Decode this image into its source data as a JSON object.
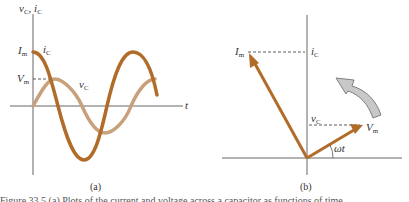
{
  "colors": {
    "current": "#b06c28",
    "voltage": "#c8a07c",
    "axis": "#555555",
    "rotation_arrow_fill": "#c8c8c8",
    "rotation_arrow_stroke": "#666666"
  },
  "panel_a": {
    "label": "(a)",
    "y_axis_label": "v",
    "y_axis_label_sub": "C",
    "y_axis_label_sep": ", ",
    "y_axis_label_2": "i",
    "y_axis_label_2_sub": "C",
    "x_axis_label": "t",
    "im_label": "I",
    "im_label_sub": "m",
    "vm_label": "V",
    "vm_label_sub": "m",
    "current_curve_label": "i",
    "current_curve_label_sub": "C",
    "voltage_curve_label": "v",
    "voltage_curve_label_sub": "C"
  },
  "panel_b": {
    "label": "(b)",
    "im_label": "I",
    "im_label_sub": "m",
    "ic_label": "i",
    "ic_label_sub": "C",
    "vc_label": "v",
    "vc_label_sub": "C",
    "vm_label": "V",
    "vm_label_sub": "m",
    "angle_label": "ωt"
  },
  "caption": "Figure 33.5 (a) Plots of the current and voltage across a capacitor as functions of time"
}
